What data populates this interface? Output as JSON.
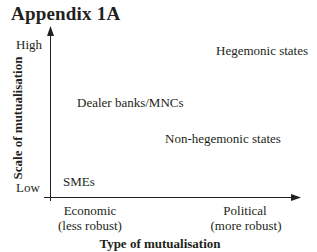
{
  "title": "Appendix 1A",
  "axes": {
    "y_label": "Scale of mutualisation",
    "y_high": "High",
    "y_low": "Low",
    "x_label": "Type of mutualisation",
    "x_left_line1": "Economic",
    "x_left_line2": "(less robust)",
    "x_right_line1": "Political",
    "x_right_line2": "(more robust)"
  },
  "points": [
    {
      "label": "Hegemonic states",
      "x": "high-political",
      "y": "high"
    },
    {
      "label": "Dealer banks/MNCs",
      "x": "economic",
      "y": "mid-high"
    },
    {
      "label": "Non-hegemonic states",
      "x": "mid-political",
      "y": "mid"
    },
    {
      "label": "SMEs",
      "x": "economic",
      "y": "low"
    }
  ],
  "colors": {
    "ink": "#231f20",
    "background": "#ffffff"
  }
}
